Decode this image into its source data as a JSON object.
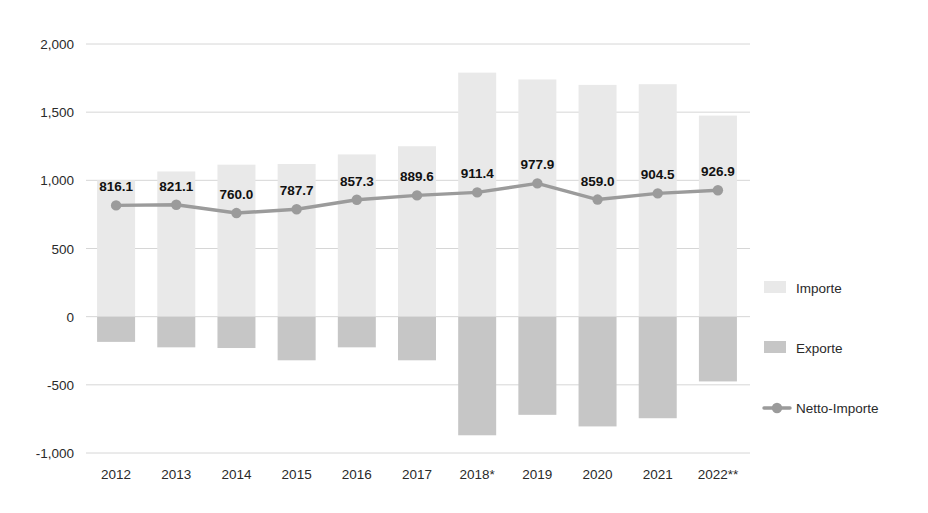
{
  "chart_data": {
    "type": "bar",
    "title": "",
    "subtitle": "",
    "xlabel": "",
    "ylabel": "",
    "ylim": [
      -1000,
      2000
    ],
    "yticks": [
      -1000,
      -500,
      0,
      500,
      1000,
      1500,
      2000
    ],
    "ytick_labels": [
      "-1,000",
      "-500",
      "0",
      "500",
      "1,000",
      "1,500",
      "2,000"
    ],
    "grid": true,
    "legend_position": "right",
    "categories": [
      "2012",
      "2013",
      "2014",
      "2015",
      "2016",
      "2017",
      "2018*",
      "2019",
      "2020",
      "2021",
      "2022**"
    ],
    "series": [
      {
        "name": "Importe",
        "type": "bar",
        "color": "#e9e9e9",
        "values": [
          1000,
          1065,
          1115,
          1120,
          1190,
          1250,
          1790,
          1740,
          1700,
          1705,
          1475
        ]
      },
      {
        "name": "Exporte",
        "type": "bar",
        "color": "#c6c6c6",
        "values": [
          -185,
          -225,
          -230,
          -320,
          -225,
          -320,
          -870,
          -720,
          -805,
          -745,
          -475
        ]
      },
      {
        "name": "Netto-Importe",
        "type": "line",
        "color": "#9b9b9b",
        "values": [
          816.1,
          821.1,
          760.0,
          787.7,
          857.3,
          889.6,
          911.4,
          977.9,
          859.0,
          904.5,
          926.9
        ],
        "data_labels": [
          "816.1",
          "821.1",
          "760.0",
          "787.7",
          "857.3",
          "889.6",
          "911.4",
          "977.9",
          "859.0",
          "904.5",
          "926.9"
        ]
      }
    ]
  },
  "legend": {
    "items": [
      {
        "label": "Importe",
        "marker": "bar-swatch-icon",
        "color": "#e9e9e9"
      },
      {
        "label": "Exporte",
        "marker": "bar-swatch-icon",
        "color": "#c6c6c6"
      },
      {
        "label": "Netto-Importe",
        "marker": "line-marker-icon",
        "color": "#9b9b9b"
      }
    ]
  },
  "colors": {
    "import_bar": "#e9e9e9",
    "export_bar": "#c6c6c6",
    "net_line": "#9b9b9b",
    "gridline": "#d6d6d6",
    "tick_text": "#2a2a2a",
    "value_text": "#111111",
    "background": "#ffffff"
  }
}
